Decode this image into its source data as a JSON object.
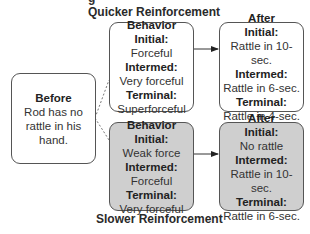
{
  "header": {
    "cut_off_title": "g"
  },
  "quicker": {
    "title": "Quicker Reinforcement",
    "behavior": {
      "heading": "Behavior",
      "initial_label": "Initial:",
      "initial_value": "Forceful",
      "intermed_label": "Intermed:",
      "intermed_value": "Very forceful",
      "terminal_label": "Terminal:",
      "terminal_value": "Superforceful"
    },
    "after": {
      "heading": "After",
      "initial_label": "Initial:",
      "initial_value": "Rattle in 10-sec.",
      "intermed_label": "Intermed:",
      "intermed_value": "Rattle in 6-sec.",
      "terminal_label": "Terminal:",
      "terminal_value": "Rattle in 4-sec."
    }
  },
  "before": {
    "heading": "Before",
    "line1": "Rod has no",
    "line2": "rattle in his",
    "line3": "hand."
  },
  "slower": {
    "title": "Slower Reinforcement",
    "behavior": {
      "heading": "Behavior",
      "initial_label": "Initial:",
      "initial_value": "Weak force",
      "intermed_label": "Intermed:",
      "intermed_value": "Forceful",
      "terminal_label": "Terminal:",
      "terminal_value": "Very forceful"
    },
    "after": {
      "heading": "After",
      "initial_label": "Initial:",
      "initial_value": "No rattle",
      "intermed_label": "Intermed:",
      "intermed_value": "Rattle in 10-sec.",
      "terminal_label": "Terminal:",
      "terminal_value": "Rattle in 6-sec."
    }
  },
  "colors": {
    "quicker_fill": "#ffffff",
    "slower_fill": "#cfcfcf",
    "border": "#555555"
  }
}
